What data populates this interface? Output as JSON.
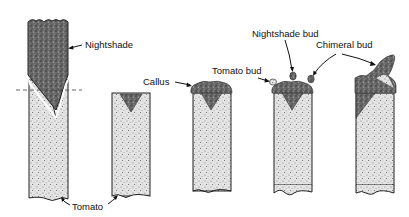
{
  "diagram": {
    "stages": [
      {
        "id": 1,
        "description": "Nightshade scion wedge-grafted onto tomato stock"
      },
      {
        "id": 2,
        "description": "Scion removed at graft line; wedge remains in tomato stock"
      },
      {
        "id": 3,
        "description": "Callus forms on cut surface"
      },
      {
        "id": 4,
        "description": "Buds arise from callus"
      },
      {
        "id": 5,
        "description": "Chimeral bud grows into shoot"
      }
    ],
    "labels": {
      "nightshade": "Nightshade",
      "tomato": "Tomato",
      "callus": "Callus",
      "tomato_bud": "Tomato bud",
      "nightshade_bud": "Nightshade bud",
      "chimeral_bud": "Chimeral bud"
    },
    "colors": {
      "nightshade_fill": "#5a5a5a",
      "tomato_fill": "#d8d8d8",
      "outline": "#222222"
    }
  }
}
